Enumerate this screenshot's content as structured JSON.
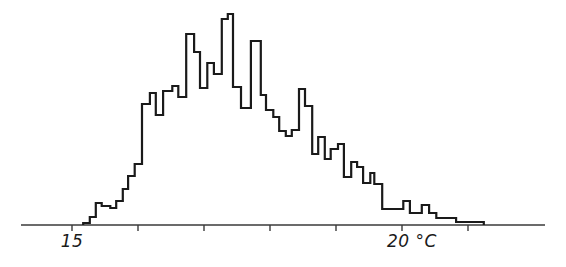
{
  "chart_data": {
    "type": "histogram",
    "title": "",
    "xlabel": "°C",
    "ylabel": "",
    "bin_width": 0.1,
    "x_unit": "°C",
    "xlim": [
      14.25,
      22.2
    ],
    "ylim": [
      0,
      211
    ],
    "grid": false,
    "legend": null,
    "x_ticks": [
      15,
      16,
      17,
      18,
      19,
      20,
      21
    ],
    "x_tick_labels": [
      {
        "value": 15,
        "label": "15"
      },
      {
        "value": 20,
        "label": "20 °C"
      }
    ],
    "y_axis_shown": false,
    "note": "Counts are relative heights (arbitrary units, read from pixel heights above baseline)",
    "steps": [
      {
        "x0": 15.17,
        "x1": 15.27,
        "y": 2
      },
      {
        "x0": 15.27,
        "x1": 15.36,
        "y": 8
      },
      {
        "x0": 15.36,
        "x1": 15.45,
        "y": 22
      },
      {
        "x0": 15.45,
        "x1": 15.58,
        "y": 19
      },
      {
        "x0": 15.58,
        "x1": 15.67,
        "y": 17
      },
      {
        "x0": 15.67,
        "x1": 15.77,
        "y": 24
      },
      {
        "x0": 15.77,
        "x1": 15.85,
        "y": 36
      },
      {
        "x0": 15.85,
        "x1": 15.95,
        "y": 49
      },
      {
        "x0": 15.95,
        "x1": 16.06,
        "y": 61
      },
      {
        "x0": 16.06,
        "x1": 16.18,
        "y": 121
      },
      {
        "x0": 16.18,
        "x1": 16.27,
        "y": 132
      },
      {
        "x0": 16.27,
        "x1": 16.38,
        "y": 110
      },
      {
        "x0": 16.38,
        "x1": 16.52,
        "y": 134
      },
      {
        "x0": 16.52,
        "x1": 16.61,
        "y": 139
      },
      {
        "x0": 16.61,
        "x1": 16.73,
        "y": 128
      },
      {
        "x0": 16.73,
        "x1": 16.85,
        "y": 191
      },
      {
        "x0": 16.85,
        "x1": 16.94,
        "y": 173
      },
      {
        "x0": 16.94,
        "x1": 17.05,
        "y": 137
      },
      {
        "x0": 17.05,
        "x1": 17.15,
        "y": 162
      },
      {
        "x0": 17.15,
        "x1": 17.27,
        "y": 151
      },
      {
        "x0": 17.27,
        "x1": 17.36,
        "y": 206
      },
      {
        "x0": 17.36,
        "x1": 17.44,
        "y": 211
      },
      {
        "x0": 17.44,
        "x1": 17.56,
        "y": 138
      },
      {
        "x0": 17.56,
        "x1": 17.71,
        "y": 117
      },
      {
        "x0": 17.71,
        "x1": 17.86,
        "y": 184
      },
      {
        "x0": 17.86,
        "x1": 17.94,
        "y": 130
      },
      {
        "x0": 17.94,
        "x1": 18.05,
        "y": 115
      },
      {
        "x0": 18.05,
        "x1": 18.14,
        "y": 108
      },
      {
        "x0": 18.14,
        "x1": 18.24,
        "y": 94
      },
      {
        "x0": 18.24,
        "x1": 18.33,
        "y": 89
      },
      {
        "x0": 18.33,
        "x1": 18.44,
        "y": 95
      },
      {
        "x0": 18.44,
        "x1": 18.53,
        "y": 136
      },
      {
        "x0": 18.53,
        "x1": 18.64,
        "y": 119
      },
      {
        "x0": 18.64,
        "x1": 18.73,
        "y": 71
      },
      {
        "x0": 18.73,
        "x1": 18.83,
        "y": 88
      },
      {
        "x0": 18.83,
        "x1": 18.92,
        "y": 66
      },
      {
        "x0": 18.92,
        "x1": 19.03,
        "y": 76
      },
      {
        "x0": 19.03,
        "x1": 19.12,
        "y": 81
      },
      {
        "x0": 19.12,
        "x1": 19.23,
        "y": 48
      },
      {
        "x0": 19.23,
        "x1": 19.32,
        "y": 63
      },
      {
        "x0": 19.32,
        "x1": 19.41,
        "y": 58
      },
      {
        "x0": 19.41,
        "x1": 19.52,
        "y": 42
      },
      {
        "x0": 19.52,
        "x1": 19.58,
        "y": 52
      },
      {
        "x0": 19.58,
        "x1": 19.7,
        "y": 41
      },
      {
        "x0": 19.7,
        "x1": 20.02,
        "y": 16
      },
      {
        "x0": 20.02,
        "x1": 20.12,
        "y": 24
      },
      {
        "x0": 20.12,
        "x1": 20.3,
        "y": 12
      },
      {
        "x0": 20.3,
        "x1": 20.41,
        "y": 20
      },
      {
        "x0": 20.41,
        "x1": 20.52,
        "y": 12
      },
      {
        "x0": 20.52,
        "x1": 20.82,
        "y": 7
      },
      {
        "x0": 20.82,
        "x1": 21.24,
        "y": 3
      }
    ]
  },
  "axis": {
    "label_15": "15",
    "label_20": "20 °C"
  },
  "style": {
    "line_color": "#1a1a1a",
    "axis_color": "#3a3a3a",
    "background": "#ffffff"
  }
}
